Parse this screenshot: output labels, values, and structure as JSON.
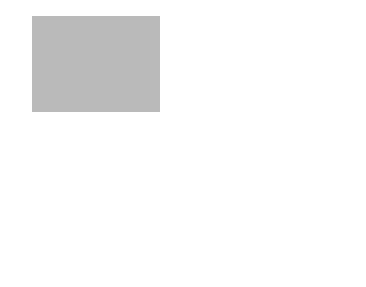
{
  "colors": {
    "panel_fill": "#b9b9b9",
    "line": "#1e1e1e",
    "background": "#ffffff"
  },
  "top_panel": {
    "y_axis_label": "y",
    "x_axis_label": "x",
    "free_stream_label": "V",
    "boundary_layer_label": "The boundary layer",
    "regions": {
      "laminar": "Laminar",
      "transitional": "Transitional",
      "turbulent": "Turbulent"
    },
    "thickness_label": "δ(x)",
    "eddies_label": "Eddies",
    "distance_label": "Many δ"
  },
  "bottom_panel": {
    "y_axis_label": "y",
    "x_axis_label": "x",
    "free_stream_arrow_label": "V",
    "free_stream_label": "Free stream",
    "heating_region_label_line1": "Region affected",
    "heating_region_label_line2": "by heating",
    "laminar_profile": {
      "t_inf_label": "T∞",
      "t_y_label": "T(y)",
      "t_s_label": "Ts",
      "t_axis_label": "T",
      "caption": "Laminar"
    },
    "turbulent_profile": {
      "t_inf_label": "T∞",
      "t_y_label": "T(y)",
      "t_s_label": "Ts",
      "t_axis_label": "T",
      "caption": "Turbulent"
    }
  }
}
